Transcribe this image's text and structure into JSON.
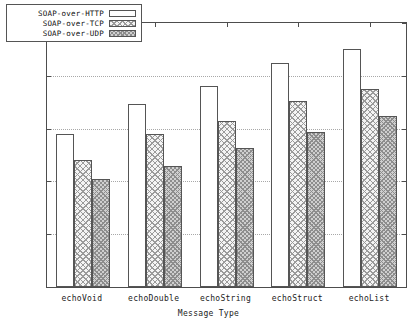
{
  "chart_data": {
    "type": "bar",
    "title": "",
    "xlabel": "Message Type",
    "ylabel": "Average Response Time (ms)",
    "ylim": [
      0,
      50
    ],
    "yticks": [
      0,
      10,
      20,
      30,
      40,
      50
    ],
    "ytick_labels": [
      "0",
      "10",
      "20",
      "30",
      "40",
      "50"
    ],
    "grid": true,
    "legend_position": "top-left",
    "categories": [
      "echoVoid",
      "echoDouble",
      "echoString",
      "echoStruct",
      "echoList"
    ],
    "series": [
      {
        "name": "SOAP-over-HTTP",
        "fill": "empty",
        "values": [
          29.0,
          34.7,
          38.0,
          42.5,
          45.0
        ]
      },
      {
        "name": "SOAP-over-TCP",
        "fill": "cross-hatch",
        "values": [
          24.0,
          29.0,
          31.5,
          35.2,
          37.5
        ]
      },
      {
        "name": "SOAP-over-UDP",
        "fill": "dense-gray",
        "values": [
          20.5,
          23.0,
          26.3,
          29.3,
          32.3
        ]
      }
    ]
  },
  "legend": {
    "items": [
      {
        "label": "SOAP-over-HTTP"
      },
      {
        "label": "SOAP-over-TCP"
      },
      {
        "label": "SOAP-over-UDP"
      }
    ]
  },
  "colors": {
    "axis": "#4d4d4d",
    "grid": "#a8a8a8",
    "bar_outline": "#555555",
    "series_http": "#ffffff",
    "series_tcp": "#f4f4f4",
    "series_udp": "#cfcfcf",
    "background": "#ffffff",
    "text": "#1a1a1a"
  }
}
